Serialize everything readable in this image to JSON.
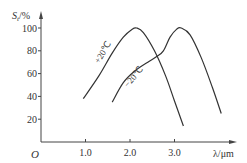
{
  "chart_data": {
    "type": "line",
    "title": "",
    "xlabel": "λ/μm",
    "ylabel": "S_t/%",
    "ylabel_main": "S",
    "ylabel_sub": "t",
    "ylabel_unit": "/%",
    "origin_label": "O",
    "xlim": [
      0,
      4.2
    ],
    "ylim": [
      0,
      105
    ],
    "grid": false,
    "legend_position": "inline",
    "x_ticks": [
      1.0,
      2.0,
      3.0
    ],
    "x_tick_labels": [
      "1.0",
      "2.0",
      "3.0"
    ],
    "y_ticks": [
      20,
      40,
      60,
      80,
      100
    ],
    "y_tick_labels": [
      "20",
      "40",
      "60",
      "80",
      "100"
    ],
    "series": [
      {
        "name": "+20℃",
        "points": [
          [
            0.95,
            38
          ],
          [
            1.3,
            58
          ],
          [
            1.6,
            78
          ],
          [
            1.85,
            92
          ],
          [
            2.05,
            99
          ],
          [
            2.15,
            100
          ],
          [
            2.3,
            96
          ],
          [
            2.55,
            80
          ],
          [
            2.8,
            58
          ],
          [
            3.0,
            36
          ],
          [
            3.2,
            14
          ]
        ]
      },
      {
        "name": "−20℃",
        "points": [
          [
            1.6,
            35
          ],
          [
            1.85,
            52
          ],
          [
            2.1,
            62
          ],
          [
            2.4,
            70
          ],
          [
            2.6,
            75
          ],
          [
            2.75,
            80
          ],
          [
            2.9,
            92
          ],
          [
            3.05,
            99
          ],
          [
            3.15,
            100
          ],
          [
            3.35,
            94
          ],
          [
            3.6,
            74
          ],
          [
            3.85,
            48
          ],
          [
            4.05,
            25
          ]
        ]
      }
    ],
    "annotations": [
      {
        "text": "+20℃",
        "near_series": "+20℃"
      },
      {
        "text": "−20℃",
        "near_series": "−20℃"
      }
    ]
  }
}
